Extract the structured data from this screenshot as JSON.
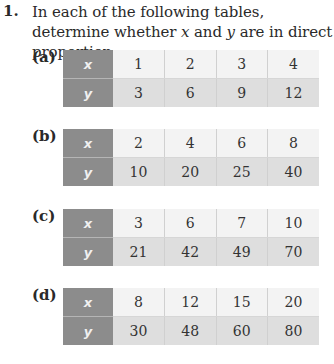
{
  "question": {
    "number": "1.",
    "text_before_x": "In each of the following tables, determine whether ",
    "var_x": "x",
    "text_mid": " and ",
    "var_y": "y",
    "text_after": " are in direct proportion."
  },
  "parts": [
    {
      "label": "(a)",
      "x_header": "x",
      "y_header": "y",
      "x": [
        "1",
        "2",
        "3",
        "4"
      ],
      "y": [
        "3",
        "6",
        "9",
        "12"
      ]
    },
    {
      "label": "(b)",
      "x_header": "x",
      "y_header": "y",
      "x": [
        "2",
        "4",
        "6",
        "8"
      ],
      "y": [
        "10",
        "20",
        "25",
        "40"
      ]
    },
    {
      "label": "(c)",
      "x_header": "x",
      "y_header": "y",
      "x": [
        "3",
        "6",
        "7",
        "10"
      ],
      "y": [
        "21",
        "42",
        "49",
        "70"
      ]
    },
    {
      "label": "(d)",
      "x_header": "x",
      "y_header": "y",
      "x": [
        "8",
        "12",
        "15",
        "20"
      ],
      "y": [
        "30",
        "48",
        "60",
        "80"
      ]
    }
  ],
  "colors": {
    "header_cell": "#8c8c8c",
    "x_row": "#f3f3f3",
    "y_row": "#dedede"
  }
}
